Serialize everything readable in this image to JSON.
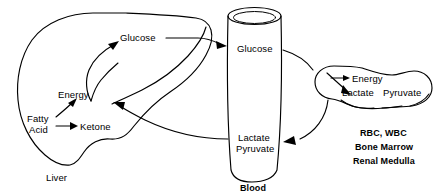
{
  "diagram": {
    "background_color": "#ffffff",
    "line_color": "#000000"
  },
  "organs": {
    "liver": {
      "name": "liver-shape",
      "caption": "Liver",
      "labels": {
        "glucose": "Glucose",
        "energy": "Energy",
        "fatty_acid_line1": "Fatty",
        "fatty_acid_line2": "Acid",
        "ketone": "Ketone"
      }
    },
    "blood": {
      "name": "blood-vessel-shape",
      "caption": "Blood",
      "labels": {
        "glucose": "Glucose",
        "lactate": "Lactate",
        "pyruvate": "Pyruvate"
      }
    },
    "peripheral": {
      "name": "peripheral-tissue-shape",
      "labels": {
        "energy": "Energy",
        "lactate": "Lactate",
        "pyruvate": "Pyruvate"
      },
      "caption_lines": [
        "RBC, WBC",
        "Bone Marrow",
        "Renal Medulla"
      ]
    }
  },
  "arrows": [
    {
      "name": "arrow-liver-glucose-to-blood",
      "from": "Liver Glucose",
      "to": "Blood Glucose"
    },
    {
      "name": "arrow-blood-glucose-to-peripheral",
      "from": "Blood Glucose",
      "to": "Peripheral Energy"
    },
    {
      "name": "arrow-peripheral-to-blood-lactate",
      "from": "Peripheral Lactate Pyruvate",
      "to": "Blood Lactate Pyruvate"
    },
    {
      "name": "arrow-blood-lactate-to-liver",
      "from": "Blood Lactate Pyruvate",
      "to": "Liver"
    },
    {
      "name": "arrow-gluconeogenesis-to-glucose",
      "from": "Liver precursors",
      "to": "Liver Glucose"
    },
    {
      "name": "arrow-fatty-acid-to-energy",
      "from": "Fatty Acid",
      "to": "Energy"
    },
    {
      "name": "arrow-fatty-acid-to-ketone",
      "from": "Fatty Acid",
      "to": "Ketone"
    }
  ]
}
